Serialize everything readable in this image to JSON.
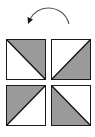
{
  "diagram": {
    "colors": {
      "fill": "#9a9a9a",
      "stroke": "#1a1a1a",
      "background": "#ffffff",
      "arrow": "#333333"
    },
    "arrow": {
      "direction": "counter-clockwise",
      "icon": "rotate-ccw-arrow"
    },
    "tiles": [
      {
        "position": "top-left",
        "diagonal": "top-left-to-bottom-right",
        "shaded": "upper-right"
      },
      {
        "position": "top-right",
        "diagonal": "bottom-left-to-top-right",
        "shaded": "lower-right"
      },
      {
        "position": "bottom-left",
        "diagonal": "bottom-left-to-top-right",
        "shaded": "upper-left"
      },
      {
        "position": "bottom-right",
        "diagonal": "top-left-to-bottom-right",
        "shaded": "lower-left"
      }
    ]
  }
}
